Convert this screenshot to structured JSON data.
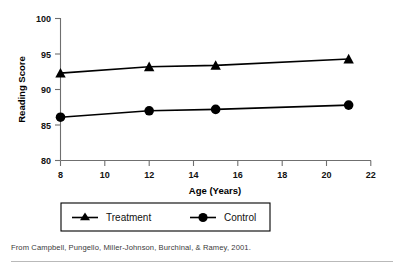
{
  "chart_data": {
    "type": "line",
    "title": "",
    "xlabel": "Age (Years)",
    "ylabel": "Reading Score",
    "xlim": [
      8,
      22
    ],
    "ylim": [
      80,
      100
    ],
    "xticks": [
      8,
      10,
      12,
      14,
      16,
      18,
      20,
      22
    ],
    "yticks": [
      80,
      85,
      90,
      95,
      100
    ],
    "grid": false,
    "legend_position": "below-plot",
    "x": [
      8,
      12,
      15,
      21
    ],
    "series": [
      {
        "name": "Treatment",
        "marker": "triangle",
        "values": [
          92.3,
          93.2,
          93.4,
          94.3
        ]
      },
      {
        "name": "Control",
        "marker": "circle",
        "values": [
          86.1,
          87.0,
          87.2,
          87.8
        ]
      }
    ]
  },
  "axes": {
    "y_title": "Reading Score",
    "x_title": "Age (Years)",
    "y_tick_labels": [
      "100",
      "95",
      "90",
      "85",
      "80"
    ],
    "x_tick_labels": [
      "8",
      "10",
      "12",
      "14",
      "16",
      "18",
      "20",
      "22"
    ]
  },
  "legend": {
    "entries": [
      {
        "label": "Treatment",
        "marker": "triangle-marker"
      },
      {
        "label": "Control",
        "marker": "circle-marker"
      }
    ]
  },
  "source": {
    "note": "From Campbell, Pungello, Miller-Johnson, Burchinal, & Ramey, 2001."
  },
  "colors": {
    "ink": "#000000",
    "axis": "#6f6f6f",
    "note": "#3a3a3a",
    "rule": "#b9b9b9",
    "background": "#ffffff"
  }
}
